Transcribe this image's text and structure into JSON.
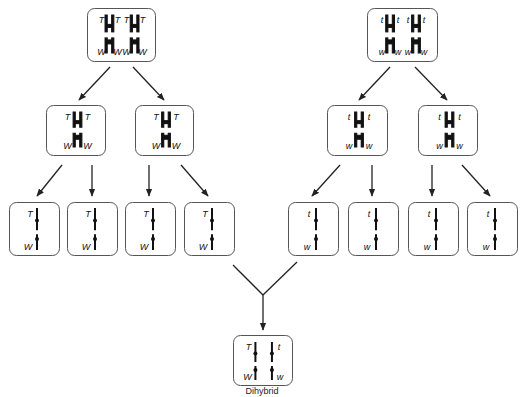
{
  "diagram": {
    "colors": {
      "line": "#222222",
      "box_stroke": "#555555",
      "background": "#ffffff"
    },
    "caption": "Dihybrid",
    "parents": [
      {
        "id": "parent-TTWW",
        "box": {
          "x": 87,
          "y": 8,
          "w": 68,
          "h": 53
        },
        "stage": "replicated-homolog-pair",
        "pairs": [
          {
            "top_left": "T",
            "top_right": "T",
            "bottom_left": "W",
            "bottom_right": "W"
          },
          {
            "top_left": "T",
            "top_right": "T",
            "bottom_left": "W",
            "bottom_right": "W"
          }
        ]
      },
      {
        "id": "parent-ttww",
        "box": {
          "x": 367,
          "y": 8,
          "w": 70,
          "h": 53
        },
        "stage": "replicated-homolog-pair",
        "pairs": [
          {
            "top_left": "t",
            "top_right": "t",
            "bottom_left": "w",
            "bottom_right": "w"
          },
          {
            "top_left": "t",
            "top_right": "t",
            "bottom_left": "w",
            "bottom_right": "w"
          }
        ]
      }
    ],
    "meiosis_I": [
      {
        "id": "mI-1",
        "box": {
          "x": 46,
          "y": 105,
          "w": 59,
          "h": 50
        },
        "top_left": "T",
        "top_right": "T",
        "bottom_left": "W",
        "bottom_right": "W"
      },
      {
        "id": "mI-2",
        "box": {
          "x": 135,
          "y": 105,
          "w": 58,
          "h": 50
        },
        "top_left": "T",
        "top_right": "T",
        "bottom_left": "W",
        "bottom_right": "W"
      },
      {
        "id": "mI-3",
        "box": {
          "x": 327,
          "y": 105,
          "w": 60,
          "h": 50
        },
        "top_left": "t",
        "top_right": "t",
        "bottom_left": "w",
        "bottom_right": "w"
      },
      {
        "id": "mI-4",
        "box": {
          "x": 418,
          "y": 105,
          "w": 59,
          "h": 50
        },
        "top_left": "t",
        "top_right": "t",
        "bottom_left": "w",
        "bottom_right": "w"
      }
    ],
    "gametes": [
      {
        "id": "g1",
        "box": {
          "x": 9,
          "y": 202,
          "w": 50,
          "h": 53
        },
        "top": "T",
        "bottom": "W"
      },
      {
        "id": "g2",
        "box": {
          "x": 67,
          "y": 202,
          "w": 50,
          "h": 53
        },
        "top": "T",
        "bottom": "W"
      },
      {
        "id": "g3",
        "box": {
          "x": 125,
          "y": 202,
          "w": 50,
          "h": 53
        },
        "top": "T",
        "bottom": "W"
      },
      {
        "id": "g4",
        "box": {
          "x": 184,
          "y": 202,
          "w": 50,
          "h": 53
        },
        "top": "T",
        "bottom": "W"
      },
      {
        "id": "g5",
        "box": {
          "x": 288,
          "y": 202,
          "w": 50,
          "h": 53
        },
        "top": "t",
        "bottom": "w"
      },
      {
        "id": "g6",
        "box": {
          "x": 348,
          "y": 202,
          "w": 50,
          "h": 53
        },
        "top": "t",
        "bottom": "w"
      },
      {
        "id": "g7",
        "box": {
          "x": 408,
          "y": 202,
          "w": 50,
          "h": 53
        },
        "top": "t",
        "bottom": "w"
      },
      {
        "id": "g8",
        "box": {
          "x": 467,
          "y": 202,
          "w": 50,
          "h": 53
        },
        "top": "t",
        "bottom": "w"
      }
    ],
    "zygote": {
      "id": "dihybrid",
      "box": {
        "x": 233,
        "y": 335,
        "w": 59,
        "h": 50
      },
      "chromosomes": [
        {
          "top": "T",
          "bottom": "W"
        },
        {
          "top": "t",
          "bottom": "w"
        }
      ]
    },
    "arrows": [
      {
        "from": [
          110,
          67
        ],
        "to": [
          79,
          100
        ]
      },
      {
        "from": [
          133,
          67
        ],
        "to": [
          164,
          100
        ]
      },
      {
        "from": [
          390,
          67
        ],
        "to": [
          359,
          100
        ]
      },
      {
        "from": [
          415,
          67
        ],
        "to": [
          447,
          100
        ]
      },
      {
        "from": [
          62,
          165
        ],
        "to": [
          37,
          196
        ]
      },
      {
        "from": [
          92,
          165
        ],
        "to": [
          92,
          196
        ]
      },
      {
        "from": [
          149,
          165
        ],
        "to": [
          149,
          196
        ]
      },
      {
        "from": [
          181,
          165
        ],
        "to": [
          208,
          196
        ]
      },
      {
        "from": [
          340,
          165
        ],
        "to": [
          312,
          196
        ]
      },
      {
        "from": [
          372,
          165
        ],
        "to": [
          372,
          196
        ]
      },
      {
        "from": [
          432,
          165
        ],
        "to": [
          432,
          196
        ]
      },
      {
        "from": [
          462,
          165
        ],
        "to": [
          490,
          196
        ]
      }
    ],
    "fusion": {
      "left_from": [
        233,
        265
      ],
      "right_from": [
        297,
        262
      ],
      "join": [
        263,
        295
      ],
      "to": [
        263,
        330
      ]
    }
  }
}
